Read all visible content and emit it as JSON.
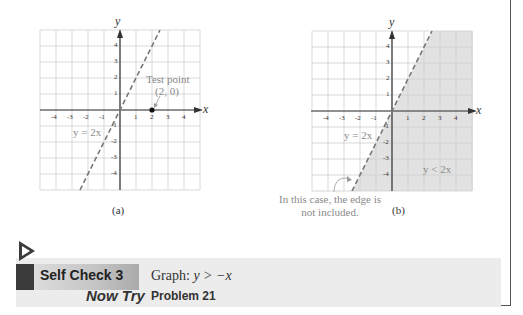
{
  "chart_data": [
    {
      "type": "line",
      "panel": "(a)",
      "title": "",
      "xlabel": "x",
      "ylabel": "y",
      "xlim": [
        -5,
        5
      ],
      "ylim": [
        -5,
        5
      ],
      "grid": true,
      "x_ticks": [
        -4,
        -3,
        -2,
        -1,
        1,
        2,
        3,
        4
      ],
      "y_ticks": [
        4,
        3,
        2,
        1,
        -1,
        -2,
        -3,
        -4
      ],
      "series": [
        {
          "name": "y = 2x",
          "style": "dashed",
          "x": [
            -2.5,
            2.5
          ],
          "y": [
            -5,
            5
          ]
        }
      ],
      "points": [
        {
          "label": "Test point (2, 0)",
          "x": 2,
          "y": 0
        }
      ],
      "annotations": [
        "y = 2x",
        "Test point",
        "(2, 0)"
      ],
      "shaded": false
    },
    {
      "type": "area",
      "panel": "(b)",
      "title": "",
      "xlabel": "x",
      "ylabel": "y",
      "xlim": [
        -5,
        5
      ],
      "ylim": [
        -5,
        5
      ],
      "grid": true,
      "x_ticks": [
        -4,
        -3,
        -2,
        -1,
        1,
        2,
        3,
        4
      ],
      "y_ticks": [
        4,
        3,
        2,
        1,
        -1,
        -2,
        -3,
        -4
      ],
      "series": [
        {
          "name": "y = 2x",
          "style": "dashed",
          "x": [
            -2.5,
            2.5
          ],
          "y": [
            -5,
            5
          ]
        }
      ],
      "shaded_region": "y < 2x",
      "annotations": [
        "y = 2x",
        "y < 2x",
        "In this case, the edge is not included."
      ]
    }
  ],
  "figure": {
    "caption_a": "(a)",
    "caption_b": "(b)",
    "axis_x": "x",
    "axis_y": "y",
    "ticks_x": [
      "-4",
      "-3",
      "-2",
      "-1",
      "1",
      "2",
      "3",
      "4"
    ],
    "ticks_y": [
      "4",
      "3",
      "2",
      "1",
      "-1",
      "-2",
      "-3",
      "-4"
    ],
    "line_label": "y = 2x",
    "test_point_label": "Test point",
    "test_point_coords": "(2, 0)",
    "region_label": "y < 2x",
    "note_line1": "In this case, the edge is",
    "note_line2": "not included.",
    "colors": {
      "grid": "#cfcfcf",
      "axis": "#333333",
      "dashed_line": "#777777",
      "shade": "#e2e2e2",
      "label_gray": "#8a8a8a"
    }
  },
  "self_check": {
    "label": "Self Check 3",
    "prompt_prefix": "Graph:  ",
    "prompt_math": "y > −x",
    "now_try_label": "Now Try",
    "now_try_target": "Problem 21"
  }
}
